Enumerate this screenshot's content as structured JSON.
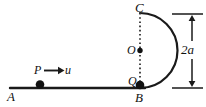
{
  "figure": {
    "type": "physics-diagram",
    "stroke_color": "#1a1a1a",
    "background_color": "#ffffff",
    "labels": {
      "point_a": "A",
      "point_b": "B",
      "point_c": "C",
      "center_o": "O",
      "point_q": "Q",
      "particle_p": "P",
      "velocity_u": "u",
      "diameter_2a": "2a"
    },
    "geometry": {
      "ground_line": {
        "x1": 10,
        "y1": 88,
        "x2": 145,
        "y2": 88
      },
      "circle_center": {
        "x": 140,
        "y": 50.5
      },
      "circle_radius": 37.5,
      "arc_description": "semicircular arc bulging right from C (top) to B (bottom)",
      "dotted_chord": {
        "x1": 140,
        "y1": 13,
        "x2": 140,
        "y2": 88
      },
      "particle_p": {
        "x": 40,
        "y": 84.5,
        "r": 4.2
      },
      "particle_q": {
        "x": 140,
        "y": 85,
        "r": 4.2
      },
      "center_dot": {
        "x": 140,
        "y": 50.5,
        "r": 2.6
      },
      "velocity_arrow": {
        "x1": 44,
        "y1": 70.5,
        "x2": 62,
        "y2": 70.5
      },
      "dimension_line": {
        "x": 192,
        "y_top": 14,
        "y_bottom": 88
      },
      "dimension_tick_top": {
        "x1": 172,
        "y": 14,
        "x2": 203
      },
      "dimension_tick_bottom": {
        "x1": 172,
        "y": 88,
        "x2": 203
      }
    }
  }
}
